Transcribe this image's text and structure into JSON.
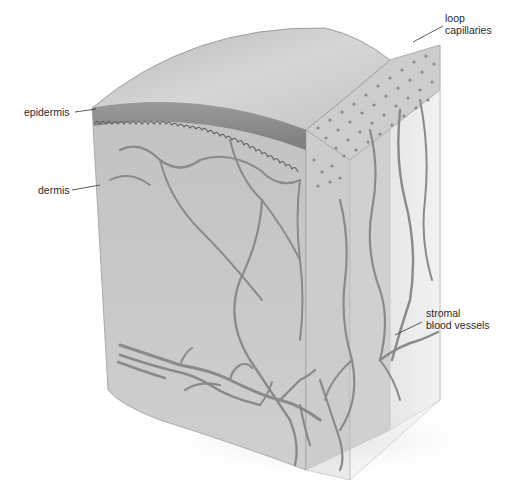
{
  "figure": {
    "background_color": "#ffffff",
    "tissue_color": "#bdbdbd",
    "vessel_color": "#8a8a8a",
    "epidermis_color": "#8f8f8f"
  },
  "labels": {
    "loop_capillaries": {
      "line1": "loop",
      "line2": "capillaries"
    },
    "epidermis": {
      "text": "epidermis"
    },
    "dermis": {
      "text": "dermis"
    },
    "stromal_blood_vessels": {
      "line1": "stromal",
      "line2": "blood vessels"
    }
  }
}
